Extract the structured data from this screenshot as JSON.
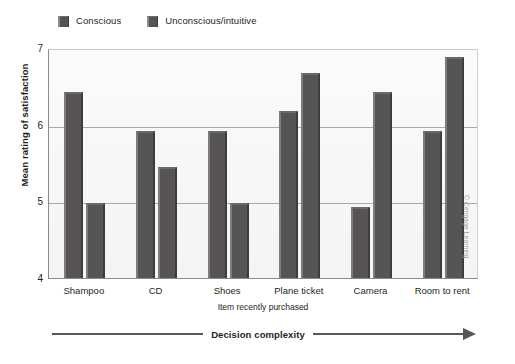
{
  "legend": {
    "position": "top-left",
    "entries": [
      {
        "label": "Conscious",
        "color": "#565454"
      },
      {
        "label": "Unconscious/intuitive",
        "color": "#565454"
      }
    ]
  },
  "axes": {
    "ylabel": "Mean rating of satisfaction",
    "xlabel": "Item recently purchased",
    "yticks": [
      "7",
      "6",
      "5",
      "4"
    ]
  },
  "annotation": {
    "complexity_label": "Decision complexity",
    "credit": "© Cengage Learning"
  },
  "chart_data": {
    "type": "bar",
    "title": "",
    "xlabel": "Item recently purchased",
    "ylabel": "Mean rating of satisfaction",
    "ylim": [
      4,
      7
    ],
    "yticks": [
      4,
      5,
      6,
      7
    ],
    "grid": true,
    "legend_position": "top-left",
    "categories": [
      "Shampoo",
      "CD",
      "Shoes",
      "Plane ticket",
      "Camera",
      "Room to rent"
    ],
    "series": [
      {
        "name": "Conscious",
        "color": "#565454",
        "values": [
          6.42,
          5.92,
          5.92,
          6.18,
          4.93,
          5.92
        ]
      },
      {
        "name": "Unconscious/intuitive",
        "color": "#565454",
        "values": [
          4.98,
          5.45,
          4.98,
          6.67,
          6.42,
          6.88
        ]
      }
    ],
    "annotations": [
      {
        "text": "Decision complexity",
        "type": "arrow",
        "direction": "left-to-right",
        "position": "below-axis"
      },
      {
        "text": "© Cengage Learning",
        "type": "credit",
        "position": "right-edge-vertical"
      }
    ]
  }
}
